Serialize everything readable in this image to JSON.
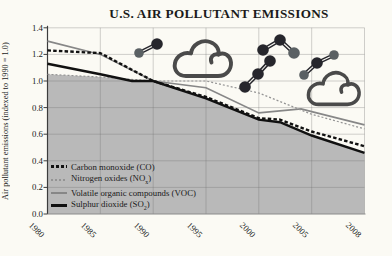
{
  "page": {
    "background": "#fbfaf4"
  },
  "chart_data": {
    "type": "line",
    "title": "U.S. AIR POLLUTANT EMISSIONS",
    "xlabel": "",
    "ylabel": "Air pollutant emissions (indexed to 1990 = 1.0)",
    "ylim": [
      0,
      1.4
    ],
    "grid": true,
    "legend_position": "lower-left-inside",
    "x_tick_years": [
      1980,
      1985,
      1990,
      1995,
      2000,
      2005,
      2008
    ],
    "x_tick_labels": [
      "1980",
      "1985",
      "1990",
      "1995",
      "2000",
      "2005",
      "2008"
    ],
    "y_ticks": [
      0,
      0.2,
      0.4,
      0.6,
      0.8,
      1.0,
      1.2,
      1.4
    ],
    "y_tick_labels": [
      "0.0",
      "0.2",
      "0.4",
      "0.6",
      "0.8",
      "1.0",
      "1.2",
      "1.4"
    ],
    "area_fill": {
      "description": "gray area under lowest line",
      "color": "#b9b9b9"
    },
    "series": [
      {
        "name": "Carbon monoxide (CO)",
        "legend": {
          "pre": "Carbon monoxide (CO)",
          "sub": "",
          "post": ""
        },
        "style": {
          "color": "#111111",
          "dash": "bold-dashed",
          "width": 2.4
        },
        "points": [
          [
            1980,
            1.23
          ],
          [
            1985,
            1.21
          ],
          [
            1990,
            1.0
          ],
          [
            1995,
            0.88
          ],
          [
            2000,
            0.72
          ],
          [
            2002,
            0.71
          ],
          [
            2005,
            0.62
          ],
          [
            2008,
            0.51
          ]
        ]
      },
      {
        "name": "Nitrogen oxides (NOx)",
        "legend": {
          "pre": "Nitrogen oxides (NO",
          "sub": "x",
          "post": ")"
        },
        "style": {
          "color": "#949494",
          "dash": "dashed",
          "width": 1.2
        },
        "points": [
          [
            1980,
            1.05
          ],
          [
            1985,
            1.03
          ],
          [
            1990,
            1.0
          ],
          [
            1995,
            1.0
          ],
          [
            2000,
            0.91
          ],
          [
            2005,
            0.75
          ],
          [
            2008,
            0.64
          ]
        ]
      },
      {
        "name": "Volatile organic compounds (VOC)",
        "legend": {
          "pre": "Volatile organic compounds (VOC)",
          "sub": "",
          "post": ""
        },
        "style": {
          "color": "#878787",
          "dash": "solid",
          "width": 1.6
        },
        "points": [
          [
            1980,
            1.3
          ],
          [
            1985,
            1.2
          ],
          [
            1990,
            1.0
          ],
          [
            1995,
            0.95
          ],
          [
            2000,
            0.76
          ],
          [
            2004,
            0.79
          ],
          [
            2005,
            0.77
          ],
          [
            2008,
            0.67
          ]
        ]
      },
      {
        "name": "Sulphur dioxide (SO2)",
        "legend": {
          "pre": "Sulphur dioxide (SO",
          "sub": "2",
          "post": ")"
        },
        "style": {
          "color": "#111111",
          "dash": "solid",
          "width": 2.4
        },
        "points": [
          [
            1980,
            1.13
          ],
          [
            1985,
            1.05
          ],
          [
            1988,
            1.0
          ],
          [
            1990,
            1.0
          ],
          [
            1995,
            0.87
          ],
          [
            2000,
            0.71
          ],
          [
            2002,
            0.69
          ],
          [
            2005,
            0.59
          ],
          [
            2008,
            0.46
          ]
        ]
      }
    ]
  },
  "decorations": {
    "colors": {
      "atom_dark": "#26262c",
      "atom_gray": "#5a6063",
      "bond": "#26262c",
      "cloud": "#4a4a4a"
    },
    "clouds": [
      {
        "name": "cloud-icon-1",
        "x": 172,
        "y": 36,
        "w": 60,
        "h": 44
      },
      {
        "name": "cloud-icon-2",
        "x": 306,
        "y": 68,
        "w": 54,
        "h": 40
      }
    ],
    "molecules": [
      {
        "name": "molecule-icon-1",
        "atoms": [
          [
            139,
            53,
            4.8,
            "gray"
          ],
          [
            157,
            44,
            5.8,
            "dark"
          ]
        ]
      },
      {
        "name": "molecule-icon-2",
        "atoms": [
          [
            245,
            87,
            5.8,
            "dark"
          ],
          [
            258,
            74,
            5.8,
            "dark"
          ],
          [
            270,
            61,
            5.8,
            "dark"
          ]
        ]
      },
      {
        "name": "molecule-icon-3",
        "atoms": [
          [
            263,
            50,
            5.8,
            "dark"
          ],
          [
            280,
            40,
            5.8,
            "dark"
          ],
          [
            294,
            53,
            5.8,
            "gray"
          ]
        ]
      },
      {
        "name": "molecule-icon-4",
        "atoms": [
          [
            304,
            75,
            4.8,
            "gray"
          ],
          [
            317,
            63,
            5.8,
            "dark"
          ],
          [
            334,
            55,
            4.8,
            "gray"
          ]
        ]
      }
    ]
  },
  "layout_meta": {
    "note": "static statistical figure, no interactive controls"
  }
}
